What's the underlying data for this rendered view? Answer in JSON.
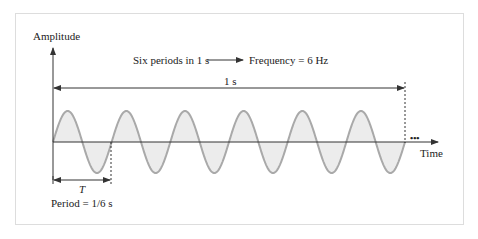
{
  "labels": {
    "y_axis": "Amplitude",
    "x_axis": "Time",
    "annotation_left": "Six periods in 1 s",
    "annotation_right": "Frequency = 6 Hz",
    "span": "1 s",
    "period_symbol": "T",
    "period_value": "Period = 1/6 s",
    "continuation": "•••"
  },
  "signal": {
    "type": "sine",
    "cycles_shown": 6,
    "duration_s": 1,
    "frequency_hz": 6,
    "period_s": "1/6"
  },
  "colors": {
    "wave_stroke": "#a9a9a9",
    "wave_fill": "#ececec",
    "axis": "#333333",
    "frame": "#dddddd"
  }
}
